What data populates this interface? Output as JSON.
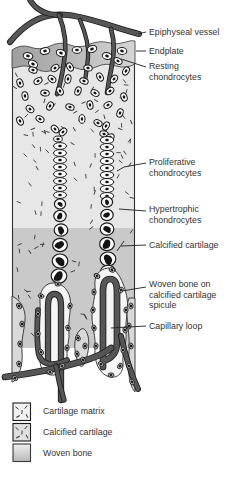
{
  "figure": {
    "labels": [
      {
        "text": "Epiphyseal vessel"
      },
      {
        "text": "Endplate"
      },
      {
        "text": "Resting\nchondrocytes"
      },
      {
        "text": "Proliferative\nchondrocytes"
      },
      {
        "text": "Hypertrophic\nchondrocytes"
      },
      {
        "text": "Calcified cartilage"
      },
      {
        "text": "Woven bone on\ncalcified cartilage\nspicule"
      },
      {
        "text": "Capillary loop"
      }
    ],
    "legend": [
      {
        "label": "Cartilage matrix",
        "icon": "cartilage-matrix-swatch",
        "fill": "#f1f1f1"
      },
      {
        "label": "Calcified cartilage",
        "icon": "calcified-cartilage-swatch",
        "fill": "#dfdfdf"
      },
      {
        "label": "Woven bone",
        "icon": "woven-bone-swatch",
        "fill": "gradient"
      }
    ],
    "colors": {
      "cartilage_matrix": "#e7e7e7",
      "calcified_cartilage": "#c9c9c9",
      "endplate_dark": "#9e9e9e",
      "endplate_light": "#d6d6d6",
      "vessel": "#565656",
      "outline": "#1d1d1d",
      "cell_fill": "#fbfbfb",
      "nucleus": "#141414",
      "bone": "#f5f5f5",
      "spicule": "#d9d9d9",
      "osteo_fill": "#c4c4c4",
      "dash": "#3f3f3f",
      "label_text": "#333333"
    }
  }
}
